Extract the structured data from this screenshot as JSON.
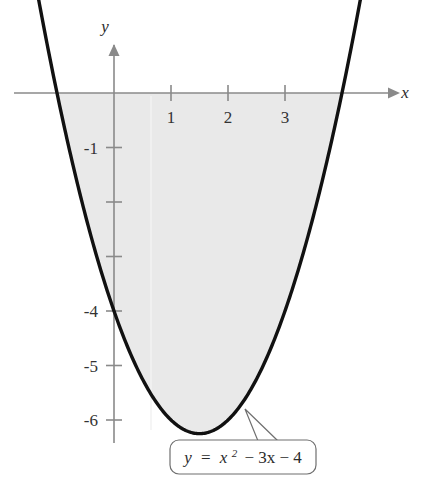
{
  "figure": {
    "background_color": "#ffffff",
    "curve_color": "#111111",
    "axis_color": "#8a8a8a",
    "shade_color": "#e9e9e9",
    "callout_border_color": "#6f6f6f"
  },
  "axes": {
    "x_axis_label": "x",
    "y_axis_label": "y",
    "x_tick_labels": [
      "1",
      "2",
      "3"
    ],
    "x_tick_values": [
      1,
      2,
      3
    ],
    "y_tick_labels": [
      "-1",
      "-4",
      "-5",
      "-6"
    ],
    "y_tick_values": [
      -1,
      -4,
      -5,
      -6
    ],
    "y_unlabeled_tick_values": [
      -2,
      -3
    ]
  },
  "callout": {
    "equation_lhs": "y",
    "equation_eq": "=",
    "equation_base": "x",
    "equation_exponent": "2",
    "equation_rest": "− 3x − 4",
    "equation_full": "y = x2 − 3x − 4"
  },
  "chart_data": {
    "type": "line",
    "title": "",
    "xlabel": "x",
    "ylabel": "y",
    "equation": "y = x^2 - 3x - 4",
    "coefficients": {
      "a": 1,
      "b": -3,
      "c": -4
    },
    "roots": [
      -1,
      4
    ],
    "vertex": {
      "x": 1.5,
      "y": -6.25
    },
    "y_intercept": -4,
    "xlim": [
      -1.35,
      4.35
    ],
    "ylim": [
      -6.9,
      0.8
    ],
    "grid": false,
    "legend": null,
    "shaded_region": {
      "description": "region between the parabola and the x-axis from x = -1 to x = 4",
      "from_x": -1,
      "to_x": 4,
      "color": "#e9e9e9"
    },
    "x_tick_labels": [
      "1",
      "2",
      "3"
    ],
    "y_tick_labels": [
      "-1",
      "-4",
      "-5",
      "-6"
    ],
    "x": [
      -1.35,
      -1.2,
      -1.0,
      -0.8,
      -0.6,
      -0.4,
      -0.2,
      0,
      0.25,
      0.5,
      0.75,
      1.0,
      1.25,
      1.5,
      1.75,
      2.0,
      2.25,
      2.5,
      2.75,
      3.0,
      3.2,
      3.4,
      3.6,
      3.8,
      4.0,
      4.2,
      4.35
    ],
    "y": [
      1.8725,
      1.04,
      0,
      -0.96,
      -1.84,
      -2.64,
      -3.36,
      -4,
      -4.6875,
      -5.25,
      -5.6875,
      -6,
      -6.1875,
      -6.25,
      -6.1875,
      -6,
      -5.6875,
      -5.25,
      -4.6875,
      -4,
      -3.36,
      -2.64,
      -1.84,
      -0.96,
      0,
      1.04,
      1.8725
    ],
    "series": [
      {
        "name": "y = x^2 - 3x - 4",
        "x": [
          -1.35,
          -1.2,
          -1.0,
          -0.8,
          -0.6,
          -0.4,
          -0.2,
          0,
          0.25,
          0.5,
          0.75,
          1.0,
          1.25,
          1.5,
          1.75,
          2.0,
          2.25,
          2.5,
          2.75,
          3.0,
          3.2,
          3.4,
          3.6,
          3.8,
          4.0,
          4.2,
          4.35
        ],
        "y": [
          1.8725,
          1.04,
          0,
          -0.96,
          -1.84,
          -2.64,
          -3.36,
          -4,
          -4.6875,
          -5.25,
          -5.6875,
          -6,
          -6.1875,
          -6.25,
          -6.1875,
          -6,
          -5.6875,
          -5.25,
          -4.6875,
          -4,
          -3.36,
          -2.64,
          -1.84,
          -0.96,
          0,
          1.04,
          1.8725
        ]
      }
    ]
  }
}
